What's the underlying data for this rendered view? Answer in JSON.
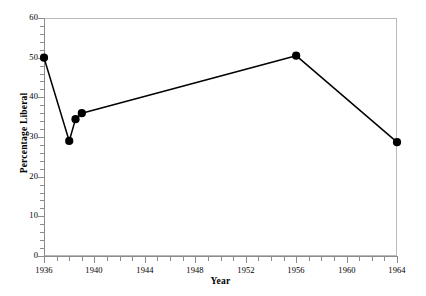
{
  "chart_data": {
    "type": "line",
    "title": "",
    "xlabel": "Year",
    "ylabel": "Percentage Liberal",
    "xlim": [
      1936,
      1964
    ],
    "ylim": [
      0,
      60
    ],
    "grid": false,
    "legend": null,
    "marker": "filled-circle",
    "line_color": "#000000",
    "marker_color": "#000000",
    "x_tick_labels": [
      "1936",
      "1940",
      "1944",
      "1948",
      "1952",
      "1956",
      "1960",
      "1964"
    ],
    "x_tick_values": [
      1936,
      1940,
      1944,
      1948,
      1952,
      1956,
      1960,
      1964
    ],
    "x_minor_tick_step": 1,
    "y_tick_labels": [
      "0",
      "10",
      "20",
      "30",
      "40",
      "50",
      "60"
    ],
    "y_tick_values": [
      0,
      10,
      20,
      30,
      40,
      50,
      60
    ],
    "series": [
      {
        "name": "Percentage Liberal",
        "x": [
          1936,
          1938,
          1938.5,
          1939,
          1956,
          1964
        ],
        "values": [
          50.0,
          29.0,
          34.5,
          36.0,
          50.5,
          28.7
        ]
      }
    ],
    "points": [
      {
        "year": 1936,
        "percentage": 50.0
      },
      {
        "year": 1938,
        "percentage": 29.0
      },
      {
        "year": 1938.5,
        "percentage": 34.5
      },
      {
        "year": 1939,
        "percentage": 36.0
      },
      {
        "year": 1956,
        "percentage": 50.5
      },
      {
        "year": 1964,
        "percentage": 28.7
      }
    ]
  },
  "axes": {
    "x_title": "Year",
    "y_title": "Percentage Liberal"
  },
  "colors": {
    "line": "#000000",
    "marker": "#000000",
    "frame": "#b9b9b9",
    "axis": "#8c8c8c",
    "background": "#ffffff"
  }
}
